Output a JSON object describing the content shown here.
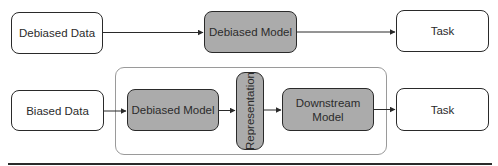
{
  "diagram": {
    "top_row": {
      "nodes": [
        {
          "id": "debiased-data",
          "label": "Debiased Data",
          "style": "white"
        },
        {
          "id": "debiased-model",
          "label": "Debiased Model",
          "style": "gray"
        },
        {
          "id": "task",
          "label": "Task",
          "style": "white"
        }
      ],
      "edges": [
        {
          "from": "debiased-data",
          "to": "debiased-model"
        },
        {
          "from": "debiased-model",
          "to": "task"
        }
      ]
    },
    "bottom_row": {
      "nodes": [
        {
          "id": "biased-data",
          "label": "Biased Data",
          "style": "white"
        },
        {
          "id": "debiased-model",
          "label": "Debiased Model",
          "style": "gray",
          "group": "pipeline"
        },
        {
          "id": "representation",
          "label": "Representation",
          "style": "gray",
          "group": "pipeline",
          "orientation": "vertical"
        },
        {
          "id": "downstream-model",
          "label": "Downstream Model",
          "label_lines": [
            "Downstream",
            "Model"
          ],
          "style": "gray",
          "group": "pipeline"
        },
        {
          "id": "task",
          "label": "Task",
          "style": "white"
        }
      ],
      "edges": [
        {
          "from": "biased-data",
          "to": "debiased-model"
        },
        {
          "from": "debiased-model",
          "to": "representation"
        },
        {
          "from": "representation",
          "to": "downstream-model"
        },
        {
          "from": "downstream-model",
          "to": "task"
        }
      ],
      "groups": [
        {
          "id": "pipeline",
          "label": ""
        }
      ]
    },
    "colors": {
      "gray_fill": "#ababab",
      "white_fill": "#ffffff",
      "border": "#2a2a2a",
      "group_border": "#9a9a9a"
    }
  }
}
